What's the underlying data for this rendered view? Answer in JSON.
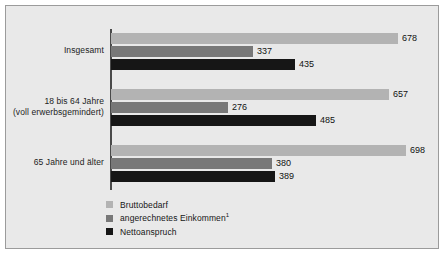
{
  "chart_data": {
    "type": "bar",
    "orientation": "horizontal",
    "title": "",
    "xlabel": "",
    "ylabel": "",
    "grid": false,
    "legend_position": "bottom-left",
    "xlim": [
      0,
      700
    ],
    "categories": [
      "Insgesamt",
      "18 bis 64 Jahre (voll erwerbsgemindert)",
      "65 Jahre und älter"
    ],
    "series": [
      {
        "name": "Bruttobedarf",
        "color": "#b3b3b3",
        "values": [
          678,
          657,
          698
        ]
      },
      {
        "name": "angerechnetes Einkommen¹",
        "color": "#787878",
        "values": [
          337,
          276,
          380
        ]
      },
      {
        "name": "Nettoanspruch",
        "color": "#161616",
        "values": [
          435,
          485,
          389
        ]
      }
    ]
  },
  "groups": [
    {
      "label_line1": "Insgesamt",
      "label_line2": "",
      "bars": [
        {
          "series": "Bruttobedarf",
          "value": 678,
          "value_label": "678",
          "label_inside": false
        },
        {
          "series": "angerechnetes Einkommen",
          "value": 337,
          "value_label": "337",
          "label_inside": false
        },
        {
          "series": "Nettoanspruch",
          "value": 435,
          "value_label": "435",
          "label_inside": false
        }
      ]
    },
    {
      "label_line1": "18 bis 64 Jahre",
      "label_line2": "(voll erwerbsgemindert)",
      "bars": [
        {
          "series": "Bruttobedarf",
          "value": 657,
          "value_label": "657",
          "label_inside": false
        },
        {
          "series": "angerechnetes Einkommen",
          "value": 276,
          "value_label": "276",
          "label_inside": false
        },
        {
          "series": "Nettoanspruch",
          "value": 485,
          "value_label": "485",
          "label_inside": false
        }
      ]
    },
    {
      "label_line1": "65 Jahre und älter",
      "label_line2": "",
      "bars": [
        {
          "series": "Bruttobedarf",
          "value": 698,
          "value_label": "698",
          "label_inside": false
        },
        {
          "series": "angerechnetes Einkommen",
          "value": 380,
          "value_label": "380",
          "label_inside": false
        },
        {
          "series": "Nettoanspruch",
          "value": 389,
          "value_label": "389",
          "label_inside": false
        }
      ]
    }
  ],
  "legend": {
    "items": [
      {
        "label": "Bruttobedarf",
        "color": "#b3b3b3",
        "footnote": ""
      },
      {
        "label": "angerechnetes Einkommen",
        "color": "#787878",
        "footnote": "1"
      },
      {
        "label": "Nettoanspruch",
        "color": "#161616",
        "footnote": ""
      }
    ]
  },
  "style": {
    "panel_bg": "#e9e9e9",
    "panel_border": "#9b9b9b",
    "axis_color": "#4a4a4a",
    "page_bg": "#ffffff"
  }
}
